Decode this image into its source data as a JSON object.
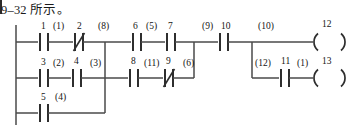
{
  "caption": {
    "text": "9–32 所示。"
  },
  "diagram": {
    "type": "ladder-logic",
    "colors": {
      "line": "#4a4a4a",
      "rail": "#555555",
      "text": "#141414",
      "background": "#ffffff"
    },
    "rails": {
      "left_rail": {
        "x": 16,
        "y_top": 25,
        "y_bottom": 125
      }
    },
    "rungs": [
      {
        "name": "rung-1",
        "y": 42
      },
      {
        "name": "rung-2",
        "y": 78
      },
      {
        "name": "rung-3",
        "y": 113
      },
      {
        "name": "rung-coil-2",
        "y": 78
      }
    ],
    "contacts": [
      {
        "id": "c1",
        "label": "1",
        "annotation": "(1)",
        "kind": "no",
        "x": 44,
        "y": 42,
        "rung": 1
      },
      {
        "id": "c2",
        "label": "2",
        "annotation": "(8)",
        "kind": "nc",
        "x": 79,
        "y": 42,
        "rung": 1
      },
      {
        "id": "c6",
        "label": "6",
        "annotation": "(5)",
        "kind": "no",
        "x": 137,
        "y": 42,
        "rung": 1
      },
      {
        "id": "c7",
        "label": "7",
        "annotation": "",
        "kind": "no",
        "x": 170,
        "y": 42,
        "rung": 1
      },
      {
        "id": "c10",
        "label": "10",
        "annotation": "(9)",
        "kind": "no",
        "x": 222,
        "y": 42,
        "rung": 1
      },
      {
        "id": "c3",
        "label": "3",
        "annotation": "(2)",
        "kind": "no",
        "x": 44,
        "y": 78,
        "rung": 2
      },
      {
        "id": "c4",
        "label": "4",
        "annotation": "(3)",
        "kind": "no",
        "x": 77,
        "y": 78,
        "rung": 2
      },
      {
        "id": "c8",
        "label": "8",
        "annotation": "(6)",
        "kind": "no",
        "x": 134,
        "y": 78,
        "rung": 2
      },
      {
        "id": "c9",
        "label": "9",
        "annotation": "(7)",
        "kind": "nc",
        "x": 168,
        "y": 78,
        "rung": 2
      },
      {
        "id": "c5",
        "label": "5",
        "annotation": "(4)",
        "kind": "no",
        "x": 44,
        "y": 113,
        "rung": 3
      },
      {
        "id": "c11",
        "label": "11",
        "annotation": "(11)",
        "kind": "no",
        "x": 283,
        "y": 78,
        "rung": 4
      }
    ],
    "coils": [
      {
        "id": "coil12",
        "label": "12",
        "annotation": "(10)",
        "x": 317,
        "y": 42
      },
      {
        "id": "coil13",
        "label": "13",
        "annotation": "(12)",
        "x": 317,
        "y": 78
      }
    ],
    "branch_labels": [
      {
        "id": "b8",
        "text": "(8)",
        "x": 100,
        "y": 26
      },
      {
        "id": "b3",
        "text": "(3)",
        "x": 92,
        "y": 62
      },
      {
        "id": "b5",
        "text": "(5)",
        "x": 148,
        "y": 26
      },
      {
        "id": "b9",
        "text": "(9)",
        "x": 205,
        "y": 26
      },
      {
        "id": "b10",
        "text": "(10)",
        "x": 262,
        "y": 26
      },
      {
        "id": "b7",
        "text": "(7)",
        "x": 184,
        "y": 62
      },
      {
        "id": "b6",
        "text": "(6)",
        "x": 146,
        "y": 62
      },
      {
        "id": "b11",
        "text": "(11)",
        "x": 257,
        "y": 62
      },
      {
        "id": "b12",
        "text": "(12)",
        "x": 298,
        "y": 62
      },
      {
        "id": "b1",
        "text": "(1)",
        "x": 56,
        "y": 26
      },
      {
        "id": "b2",
        "text": "(2)",
        "x": 56,
        "y": 62
      },
      {
        "id": "b4",
        "text": "(4)",
        "x": 57,
        "y": 97
      }
    ],
    "verticals": [
      {
        "id": "v-left-branch",
        "x": 105,
        "y_top": 42,
        "y_bottom": 113
      },
      {
        "id": "v-mid-branch",
        "x": 194,
        "y_top": 42,
        "y_bottom": 78
      },
      {
        "id": "v-coil-branch",
        "x": 252,
        "y_top": 42,
        "y_bottom": 78
      }
    ]
  }
}
